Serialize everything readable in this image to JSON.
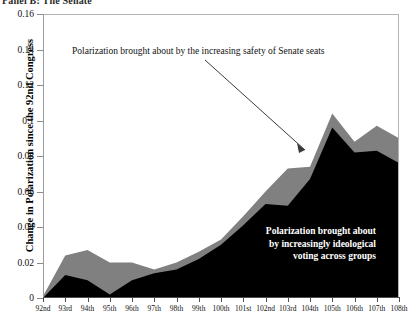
{
  "panel": {
    "title": "Panel B: The Senate"
  },
  "axes": {
    "ylabel": "Change in Polarization since the 92nd Congress",
    "xlabel": "",
    "yticks": [
      "0.16",
      "0.14",
      "0.12",
      "0.1",
      "0.08",
      "0.06",
      "0.04",
      "0.02",
      "0"
    ]
  },
  "annotations": {
    "top": "Polarization brought about by the increasing safety of  Senate seats",
    "bottom_lines": [
      "Polarization brought about",
      "by increasingly ideological",
      "voting across groups"
    ]
  },
  "colors": {
    "series_ideological": "#000000",
    "series_safety": "#808080",
    "axis": "#4d4d4d",
    "background": "#ffffff",
    "anno_bottom_text": "#ffffff"
  },
  "chart_data": {
    "type": "area",
    "title": "Panel B: The Senate",
    "xlabel": "",
    "ylabel": "Change in Polarization since the 92nd Congress",
    "ylim": [
      0,
      0.16
    ],
    "ytick_values": [
      0,
      0.02,
      0.04,
      0.06,
      0.08,
      0.1,
      0.12,
      0.14,
      0.16
    ],
    "grid": false,
    "legend": "inline annotations",
    "stacked": true,
    "categories": [
      "92nd",
      "93rd",
      "94th",
      "95th",
      "96th",
      "97th",
      "98th",
      "99th",
      "100th",
      "101st",
      "102nd",
      "103rd",
      "104th",
      "105th",
      "106th",
      "107th",
      "108th"
    ],
    "series": [
      {
        "name": "Polarization brought about by increasingly ideological voting across groups",
        "color": "#000000",
        "values": [
          0.0,
          0.013,
          0.01,
          0.002,
          0.01,
          0.014,
          0.016,
          0.022,
          0.03,
          0.041,
          0.053,
          0.052,
          0.067,
          0.096,
          0.082,
          0.083,
          0.076
        ]
      },
      {
        "name": "Polarization brought about by the increasing safety of Senate seats",
        "color": "#808080",
        "values": [
          0.001,
          0.011,
          0.017,
          0.018,
          0.01,
          0.002,
          0.004,
          0.004,
          0.003,
          0.005,
          0.007,
          0.021,
          0.007,
          0.008,
          0.006,
          0.014,
          0.014
        ]
      }
    ],
    "totals": [
      0.001,
      0.024,
      0.027,
      0.02,
      0.02,
      0.016,
      0.02,
      0.026,
      0.033,
      0.046,
      0.06,
      0.073,
      0.074,
      0.104,
      0.088,
      0.097,
      0.09
    ]
  }
}
